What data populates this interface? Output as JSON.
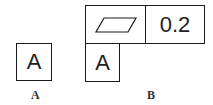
{
  "diagram": {
    "left": {
      "datum_letter": "A",
      "caption": "A"
    },
    "right": {
      "symbol": "flatness-parallelogram",
      "tolerance": "0.2",
      "datum_letter": "A",
      "caption": "B"
    }
  }
}
